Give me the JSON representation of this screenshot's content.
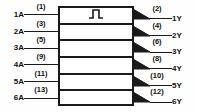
{
  "diagram": {
    "symbol_name": "schmitt-trigger-hysteresis",
    "line_color": "#1a1a1a",
    "background_color": "#fefefe",
    "channel_count": 6,
    "inputs": [
      {
        "name": "1A",
        "pin": "(1)"
      },
      {
        "name": "2A",
        "pin": "(3)"
      },
      {
        "name": "3A",
        "pin": "(5)"
      },
      {
        "name": "4A",
        "pin": "(9)"
      },
      {
        "name": "5A",
        "pin": "(11)"
      },
      {
        "name": "6A",
        "pin": "(13)"
      }
    ],
    "outputs": [
      {
        "name": "1Y",
        "pin": "(2)"
      },
      {
        "name": "2Y",
        "pin": "(4)"
      },
      {
        "name": "3Y",
        "pin": "(6)"
      },
      {
        "name": "4Y",
        "pin": "(8)"
      },
      {
        "name": "5Y",
        "pin": "(10)"
      },
      {
        "name": "6Y",
        "pin": "(12)"
      }
    ]
  }
}
